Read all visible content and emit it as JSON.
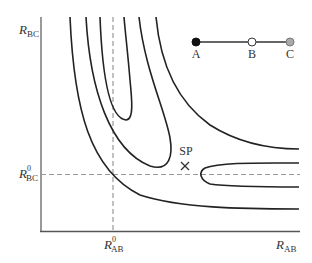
{
  "diagram": {
    "type": "potential-energy-contour",
    "axes": {
      "y_label": {
        "main": "R",
        "sub": "BC"
      },
      "x_label": {
        "main": "R",
        "sub": "AB"
      },
      "y_ref_label": {
        "main": "R",
        "sup": "0",
        "sub": "BC"
      },
      "x_ref_label": {
        "main": "R",
        "sup": "0",
        "sub": "AB"
      }
    },
    "saddle_point": {
      "label": "SP",
      "marker": "×"
    },
    "molecule": {
      "atoms": [
        {
          "label": "A",
          "fill": "#111111"
        },
        {
          "label": "B",
          "fill": "#ffffff"
        },
        {
          "label": "C",
          "fill": "#aaaaaa"
        }
      ]
    },
    "colors": {
      "axis": "#777777",
      "contour": "#222222",
      "dashed": "#999999",
      "text": "#333333"
    }
  }
}
